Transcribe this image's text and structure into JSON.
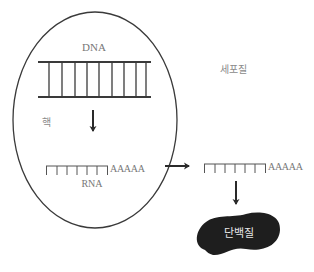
{
  "diagram": {
    "colors": {
      "stroke": "#3a3a3a",
      "label": "#777777",
      "protein_fill": "#1e1e1e",
      "protein_text": "#e8e8e8",
      "background": "#ffffff"
    },
    "regions": {
      "nucleus": {
        "label": "핵"
      },
      "cytoplasm": {
        "label": "세포질"
      }
    },
    "molecules": {
      "dna": {
        "label": "DNA",
        "rungs": 9
      },
      "nuclear_rna": {
        "label": "RNA",
        "poly_a_tail": "AAAAA",
        "teeth": 7
      },
      "cytoplasmic_rna": {
        "poly_a_tail": "AAAAA",
        "teeth": 7
      },
      "protein": {
        "label": "단백질"
      }
    },
    "arrows": [
      {
        "from": "DNA",
        "to": "RNA",
        "direction": "down"
      },
      {
        "from": "RNA (nucleus)",
        "to": "RNA (cytoplasm)",
        "direction": "right"
      },
      {
        "from": "RNA (cytoplasm)",
        "to": "단백질",
        "direction": "down"
      }
    ]
  }
}
